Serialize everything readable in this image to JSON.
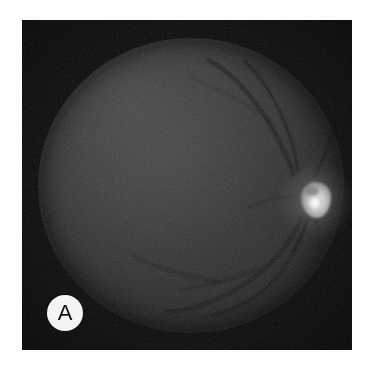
{
  "figure": {
    "modality": "retinal fundus photograph",
    "rendering": "grayscale",
    "panel_label": "A",
    "background_color": "#ffffff",
    "plate_color": "#0a0a0a",
    "label_circle_color": "#f4f4f4",
    "label_text_color": "#111111"
  },
  "image_content": {
    "fundus": {
      "name": "retinal-fundus-disc",
      "fill_description": "dark gray circular fundus",
      "center_tone": "#2e2e2e",
      "edge_tone": "#151515",
      "highlight_tone": "#3a3a3a"
    },
    "optic_disc": {
      "name": "optic-disc",
      "description": "bright irregular optic nerve head, temporal right of center",
      "core_color": "#fdfdfd",
      "halo_color": "#c4c4c4"
    },
    "vessels": {
      "name": "retinal-vessels",
      "description": "faint dark vascular arcades emerging from the optic disc",
      "color": "#101010"
    }
  }
}
